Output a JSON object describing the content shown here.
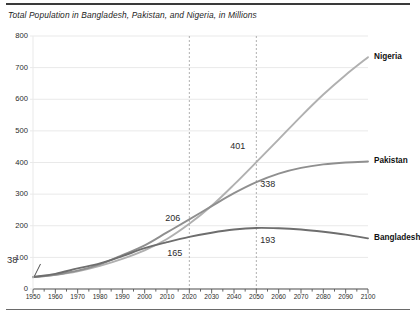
{
  "chart_data": {
    "type": "line",
    "title": "Total Population in Bangladesh, Pakistan, and Nigeria, in Millions",
    "xlabel": "",
    "ylabel": "",
    "xlim": [
      1950,
      2100
    ],
    "ylim": [
      0,
      800
    ],
    "ytick_step": 100,
    "xtick_step": 10,
    "minor_xtick_step": 5,
    "grid": "horizontal",
    "legend": "right-end-labels",
    "yticks": [
      "800",
      "700",
      "600",
      "500",
      "400",
      "300",
      "200",
      "100",
      "0"
    ],
    "xticks": [
      "1950",
      "1960",
      "1970",
      "1980",
      "1990",
      "2000",
      "2010",
      "2020",
      "2030",
      "2040",
      "2050",
      "2060",
      "2070",
      "2080",
      "2090",
      "2100"
    ],
    "reference_lines": [
      {
        "x": 2020,
        "style": "dashed"
      },
      {
        "x": 2050,
        "style": "dashed"
      }
    ],
    "x": [
      1950,
      1960,
      1970,
      1980,
      1990,
      2000,
      2010,
      2020,
      2030,
      2040,
      2050,
      2060,
      2070,
      2080,
      2090,
      2100
    ],
    "series": [
      {
        "name": "Nigeria",
        "color": "#b0b0b0",
        "values": [
          38,
          45,
          56,
          73,
          95,
          122,
          158,
          206,
          263,
          330,
          401,
          473,
          546,
          615,
          677,
          733
        ]
      },
      {
        "name": "Pakistan",
        "color": "#8f8f8f",
        "values": [
          37,
          45,
          58,
          78,
          107,
          138,
          179,
          220,
          262,
          303,
          338,
          365,
          383,
          394,
          400,
          403
        ]
      },
      {
        "name": "Bangladesh",
        "color": "#6e6e6e",
        "values": [
          38,
          48,
          65,
          81,
          104,
          129,
          148,
          165,
          178,
          188,
          193,
          192,
          188,
          181,
          172,
          160
        ]
      }
    ],
    "annotations": [
      {
        "label": "38",
        "x": 1950,
        "y": 38,
        "series": "start",
        "leader": true
      },
      {
        "label": "206",
        "x": 2020,
        "y": 206,
        "series": "Nigeria"
      },
      {
        "label": "165",
        "x": 2020,
        "y": 165,
        "series": "Bangladesh"
      },
      {
        "label": "401",
        "x": 2050,
        "y": 401,
        "series": "Nigeria"
      },
      {
        "label": "338",
        "x": 2050,
        "y": 338,
        "series": "Pakistan"
      },
      {
        "label": "193",
        "x": 2050,
        "y": 193,
        "series": "Bangladesh"
      }
    ]
  },
  "colors": {
    "grid": "#e9e9e9",
    "axis": "#555555",
    "dashed": "#9a9a9a",
    "text": "#1d1d1d",
    "rule": "#3a3a3a"
  }
}
